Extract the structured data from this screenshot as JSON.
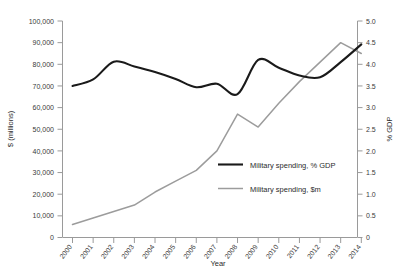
{
  "chart_data": {
    "type": "line",
    "title": "",
    "xlabel": "Year",
    "ylabel": "$ (millions)",
    "y2label": "% GDP",
    "categories": [
      "2000",
      "2001",
      "2002",
      "2003",
      "2004",
      "2005",
      "2006",
      "2007",
      "2008",
      "2009",
      "2010",
      "2011",
      "2012",
      "2013",
      "2014"
    ],
    "x": [
      2000,
      2001,
      2002,
      2003,
      2004,
      2005,
      2006,
      2007,
      2008,
      2009,
      2010,
      2011,
      2012,
      2013,
      2014
    ],
    "ylim": [
      0,
      100000
    ],
    "y2lim": [
      0,
      5.0
    ],
    "grid": false,
    "legend_position": "center-right-inside",
    "yticks": [
      0,
      10000,
      20000,
      30000,
      40000,
      50000,
      60000,
      70000,
      80000,
      90000,
      100000
    ],
    "ytick_labels": [
      "0",
      "10,000",
      "20,000",
      "30,000",
      "40,000",
      "50,000",
      "60,000",
      "70,000",
      "80,000",
      "90,000",
      "100,000"
    ],
    "y2ticks": [
      0,
      0.5,
      1.0,
      1.5,
      2.0,
      2.5,
      3.0,
      3.5,
      4.0,
      4.5,
      5.0
    ],
    "y2tick_labels": [
      "0",
      "0.5",
      "1.0",
      "1.5",
      "2.0",
      "2.5",
      "3.0",
      "3.5",
      "4.0",
      "4.5",
      "5.0"
    ],
    "series": [
      {
        "name": "Military spending, % GDP",
        "axis": "right",
        "color": "#1a1a1a",
        "values": [
          3.5,
          3.65,
          4.06,
          3.95,
          3.82,
          3.66,
          3.47,
          3.55,
          3.31,
          4.1,
          3.92,
          3.74,
          3.7,
          4.05,
          4.46
        ]
      },
      {
        "name": "Military spending, $m",
        "axis": "left",
        "color": "#9c9c9c",
        "values": [
          6000,
          9000,
          12000,
          15000,
          21000,
          26000,
          31000,
          40000,
          57000,
          51000,
          62000,
          72000,
          81000,
          90000,
          85000
        ]
      }
    ],
    "legend_entries": [
      {
        "label": "Military spending, % GDP",
        "color": "#1a1a1a",
        "style": "thick"
      },
      {
        "label": "Military spending, $m",
        "color": "#9c9c9c",
        "style": "thin"
      }
    ],
    "colors": {
      "gdp_line": "#1a1a1a",
      "usd_line": "#9c9c9c",
      "axis": "#9a9a9a",
      "text": "#2b2b2b",
      "background": "#ffffff"
    }
  }
}
